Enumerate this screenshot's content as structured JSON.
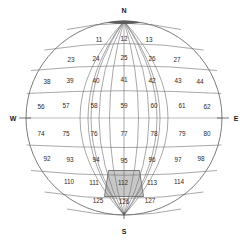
{
  "diagram": {
    "type": "sphere-grid",
    "cardinals": {
      "north": "N",
      "south": "S",
      "east": "E",
      "west": "W"
    },
    "colors": {
      "background": "#ffffff",
      "grid_stroke": "#6e6e6e",
      "outline_stroke": "#5a5a5a",
      "label_text": "#2b2b2b",
      "highlight_fill": "#c8c8c8",
      "pole_cap": "#5c5c5c",
      "axis": "#3a3a3a"
    },
    "highlighted_cell": "112",
    "rows": [
      {
        "row_index": 1,
        "cells": [
          {
            "id": "r1c1",
            "label": "11",
            "x": 99,
            "y": 40,
            "highlighted": false
          },
          {
            "id": "r1c2",
            "label": "12",
            "x": 124,
            "y": 39,
            "highlighted": false
          },
          {
            "id": "r1c3",
            "label": "13",
            "x": 149,
            "y": 40,
            "highlighted": false
          }
        ]
      },
      {
        "row_index": 2,
        "cells": [
          {
            "id": "r2c1",
            "label": "23",
            "x": 71,
            "y": 60,
            "highlighted": false
          },
          {
            "id": "r2c2",
            "label": "24",
            "x": 96,
            "y": 59,
            "highlighted": false
          },
          {
            "id": "r2c3",
            "label": "25",
            "x": 124,
            "y": 58,
            "highlighted": false
          },
          {
            "id": "r2c4",
            "label": "26",
            "x": 152,
            "y": 59,
            "highlighted": false
          },
          {
            "id": "r2c5",
            "label": "27",
            "x": 177,
            "y": 60,
            "highlighted": false
          }
        ]
      },
      {
        "row_index": 3,
        "cells": [
          {
            "id": "r3c1",
            "label": "38",
            "x": 47,
            "y": 82,
            "highlighted": false
          },
          {
            "id": "r3c2",
            "label": "39",
            "x": 70,
            "y": 81,
            "highlighted": false
          },
          {
            "id": "r3c3",
            "label": "40",
            "x": 96,
            "y": 81,
            "highlighted": false
          },
          {
            "id": "r3c4",
            "label": "41",
            "x": 124,
            "y": 80,
            "highlighted": false
          },
          {
            "id": "r3c5",
            "label": "42",
            "x": 152,
            "y": 81,
            "highlighted": false
          },
          {
            "id": "r3c6",
            "label": "43",
            "x": 178,
            "y": 81,
            "highlighted": false
          },
          {
            "id": "r3c7",
            "label": "44",
            "x": 200,
            "y": 82,
            "highlighted": false
          }
        ]
      },
      {
        "row_index": 4,
        "cells": [
          {
            "id": "r4c1",
            "label": "56",
            "x": 41,
            "y": 107,
            "highlighted": false
          },
          {
            "id": "r4c2",
            "label": "57",
            "x": 66,
            "y": 106,
            "highlighted": false
          },
          {
            "id": "r4c3",
            "label": "58",
            "x": 94,
            "y": 106,
            "highlighted": false
          },
          {
            "id": "r4c4",
            "label": "59",
            "x": 124,
            "y": 106,
            "highlighted": false
          },
          {
            "id": "r4c5",
            "label": "60",
            "x": 154,
            "y": 106,
            "highlighted": false
          },
          {
            "id": "r4c6",
            "label": "61",
            "x": 182,
            "y": 106,
            "highlighted": false
          },
          {
            "id": "r4c7",
            "label": "62",
            "x": 207,
            "y": 107,
            "highlighted": false
          }
        ]
      },
      {
        "row_index": 5,
        "cells": [
          {
            "id": "r5c1",
            "label": "74",
            "x": 41,
            "y": 134,
            "highlighted": false
          },
          {
            "id": "r5c2",
            "label": "75",
            "x": 66,
            "y": 134,
            "highlighted": false
          },
          {
            "id": "r5c3",
            "label": "76",
            "x": 94,
            "y": 134,
            "highlighted": false
          },
          {
            "id": "r5c4",
            "label": "77",
            "x": 124,
            "y": 134,
            "highlighted": false
          },
          {
            "id": "r5c5",
            "label": "78",
            "x": 154,
            "y": 134,
            "highlighted": false
          },
          {
            "id": "r5c6",
            "label": "79",
            "x": 182,
            "y": 134,
            "highlighted": false
          },
          {
            "id": "r5c7",
            "label": "80",
            "x": 207,
            "y": 134,
            "highlighted": false
          }
        ]
      },
      {
        "row_index": 6,
        "cells": [
          {
            "id": "r6c1",
            "label": "92",
            "x": 47,
            "y": 159,
            "highlighted": false
          },
          {
            "id": "r6c2",
            "label": "93",
            "x": 70,
            "y": 160,
            "highlighted": false
          },
          {
            "id": "r6c3",
            "label": "94",
            "x": 96,
            "y": 160,
            "highlighted": false
          },
          {
            "id": "r6c4",
            "label": "95",
            "x": 124,
            "y": 161,
            "highlighted": false
          },
          {
            "id": "r6c5",
            "label": "96",
            "x": 152,
            "y": 160,
            "highlighted": false
          },
          {
            "id": "r6c6",
            "label": "97",
            "x": 178,
            "y": 160,
            "highlighted": false
          },
          {
            "id": "r6c7",
            "label": "98",
            "x": 201,
            "y": 159,
            "highlighted": false
          }
        ]
      },
      {
        "row_index": 7,
        "cells": [
          {
            "id": "r7c1",
            "label": "110",
            "x": 69,
            "y": 182,
            "highlighted": false
          },
          {
            "id": "r7c2",
            "label": "111",
            "x": 94,
            "y": 183,
            "highlighted": false
          },
          {
            "id": "r7c3",
            "label": "112",
            "x": 123,
            "y": 183,
            "highlighted": true
          },
          {
            "id": "r7c4",
            "label": "113",
            "x": 152,
            "y": 183,
            "highlighted": false
          },
          {
            "id": "r7c5",
            "label": "114",
            "x": 179,
            "y": 182,
            "highlighted": false
          }
        ]
      },
      {
        "row_index": 8,
        "cells": [
          {
            "id": "r8c1",
            "label": "125",
            "x": 98,
            "y": 201,
            "highlighted": false
          },
          {
            "id": "r8c2",
            "label": "126",
            "x": 124,
            "y": 202,
            "highlighted": false
          },
          {
            "id": "r8c3",
            "label": "127",
            "x": 150,
            "y": 201,
            "highlighted": false
          }
        ]
      }
    ]
  }
}
